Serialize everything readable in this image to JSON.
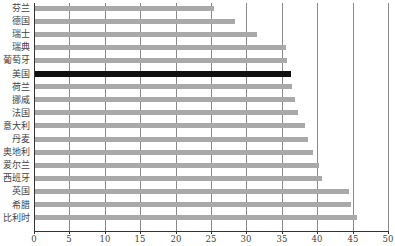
{
  "chart_data": {
    "type": "bar",
    "orientation": "horizontal",
    "title": "",
    "xlabel": "",
    "ylabel": "",
    "xlim": [
      0,
      50
    ],
    "x_ticks": [
      0,
      5,
      10,
      15,
      20,
      25,
      30,
      35,
      40,
      45,
      50
    ],
    "grid": true,
    "legend": null,
    "categories": [
      "芬兰",
      "德国",
      "瑞士",
      "瑞典",
      "葡萄牙",
      "美国",
      "荷兰",
      "挪威",
      "法国",
      "意大利",
      "丹麦",
      "奥地利",
      "爱尔兰",
      "西班牙",
      "英国",
      "希腊",
      "比利时"
    ],
    "values": [
      25.3,
      28.3,
      31.4,
      35.4,
      35.6,
      36.1,
      36.3,
      36.7,
      37.2,
      38.1,
      38.5,
      39.2,
      40.1,
      40.5,
      44.3,
      44.6,
      45.5
    ],
    "highlight": "美国",
    "colors": {
      "bar": "#a9a9a9",
      "highlight": "#111111",
      "grid": "#8a8a8a",
      "axis": "#333333"
    }
  }
}
